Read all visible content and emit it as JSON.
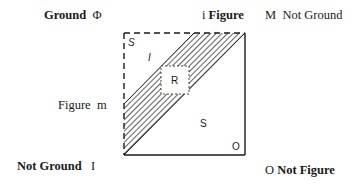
{
  "labels": {
    "top_left": {
      "word": "Ground",
      "symbol": "Φ"
    },
    "top_middle": {
      "symbol": "i",
      "word": "Figure"
    },
    "top_right": {
      "symbol": "M",
      "word": "Not Ground"
    },
    "left_middle": {
      "word": "Figure",
      "symbol": "m"
    },
    "bottom_left": {
      "word": "Not Ground",
      "symbol": "I"
    },
    "bottom_right": {
      "symbol": "O",
      "word": "Not Figure"
    }
  },
  "regions": {
    "top_left_corner": "S",
    "upper_triangle": "I",
    "center_box": "R",
    "lower_triangle": "S",
    "bottom_right_corner": "O"
  }
}
